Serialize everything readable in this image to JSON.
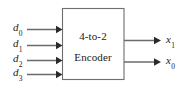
{
  "diagram": {
    "type": "block-diagram",
    "title": "4-to-2 Encoder",
    "block": {
      "line1": "4-to-2",
      "line2": "Encoder"
    },
    "inputs": [
      {
        "name": "d0",
        "base": "d",
        "sub": "0"
      },
      {
        "name": "d1",
        "base": "d",
        "sub": "1"
      },
      {
        "name": "d2",
        "base": "d",
        "sub": "2"
      },
      {
        "name": "d3",
        "base": "d",
        "sub": "3"
      }
    ],
    "outputs": [
      {
        "name": "x1",
        "base": "x",
        "sub": "1"
      },
      {
        "name": "x0",
        "base": "x",
        "sub": "0"
      }
    ],
    "colors": {
      "background": "#ffffff",
      "block_border": "#6e6e6e",
      "wire": "#6b6b6b",
      "arrowhead": "#2a2a2a",
      "text": "#1a1a1a"
    }
  }
}
